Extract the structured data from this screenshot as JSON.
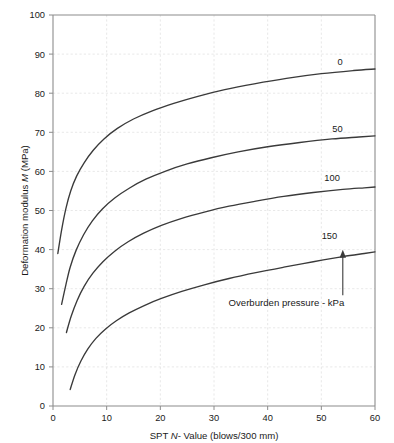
{
  "chart_data": {
    "type": "line",
    "title": "",
    "xlabel": "SPT N- Value (blows/300 mm)",
    "xlabel_parts": {
      "pre": "SPT ",
      "italic": "N",
      "post": "- Value (blows/300 mm)"
    },
    "ylabel": "Deformation modulus M (MPa)",
    "ylabel_parts": {
      "pre": "Deformation modulus ",
      "italic": "M",
      "post": " (MPa)"
    },
    "xlim": [
      0,
      60
    ],
    "ylim": [
      0,
      100
    ],
    "xticks": [
      0,
      10,
      20,
      30,
      40,
      50,
      60
    ],
    "yticks": [
      0,
      10,
      20,
      30,
      40,
      50,
      60,
      70,
      80,
      90,
      100
    ],
    "grid": true,
    "legend_position": "inline-right-of-curve",
    "annotations": [
      {
        "text": "Overburden pressure - kPa",
        "x": 43.5,
        "y": 25.5,
        "arrow_to_x": 54.0,
        "arrow_to_y": 41.5
      }
    ],
    "series": [
      {
        "name": "0",
        "label": "0",
        "label_x": 53.5,
        "label_y": 88.0,
        "x": [
          0.9,
          1.6,
          2.4,
          3.3,
          4.4,
          5.8,
          7.5,
          9.5,
          12.0,
          15.0,
          18.5,
          22.5,
          27.0,
          32.0,
          37.5,
          43.5,
          50.0,
          56.0,
          60.0
        ],
        "y": [
          39.0,
          45.0,
          50.5,
          55.0,
          58.8,
          62.2,
          65.4,
          68.3,
          71.0,
          73.4,
          75.5,
          77.4,
          79.2,
          80.9,
          82.4,
          83.8,
          85.0,
          85.8,
          86.2
        ]
      },
      {
        "name": "50",
        "label": "50",
        "label_x": 53.0,
        "label_y": 71.0,
        "x": [
          1.6,
          2.4,
          3.2,
          4.3,
          5.7,
          7.3,
          9.2,
          11.5,
          14.2,
          17.3,
          21.0,
          25.0,
          29.5,
          34.5,
          40.0,
          46.0,
          52.0,
          57.0,
          60.0
        ],
        "y": [
          26.0,
          31.0,
          35.5,
          39.8,
          43.8,
          47.3,
          50.4,
          53.2,
          55.7,
          58.0,
          60.1,
          61.9,
          63.5,
          65.0,
          66.3,
          67.4,
          68.3,
          68.8,
          69.1
        ]
      },
      {
        "name": "100",
        "label": "100",
        "label_x": 52.0,
        "label_y": 58.5,
        "x": [
          2.5,
          3.4,
          4.5,
          5.8,
          7.4,
          9.3,
          11.5,
          14.0,
          16.9,
          20.2,
          24.0,
          28.2,
          32.8,
          37.8,
          43.0,
          48.5,
          54.0,
          58.0,
          60.0
        ],
        "y": [
          18.8,
          23.0,
          27.0,
          30.6,
          33.9,
          36.9,
          39.6,
          42.0,
          44.2,
          46.2,
          48.0,
          49.6,
          51.1,
          52.4,
          53.6,
          54.6,
          55.4,
          55.8,
          56.0
        ]
      },
      {
        "name": "150",
        "label": "150",
        "label_x": 51.5,
        "label_y": 43.5,
        "x": [
          3.2,
          4.1,
          5.2,
          6.5,
          8.0,
          9.8,
          11.8,
          14.2,
          17.0,
          20.2,
          24.0,
          28.2,
          32.8,
          37.8,
          43.0,
          48.5,
          54.0,
          58.0,
          60.0
        ],
        "y": [
          4.2,
          8.0,
          11.5,
          14.6,
          17.3,
          19.7,
          21.8,
          23.8,
          25.7,
          27.5,
          29.3,
          31.0,
          32.6,
          34.1,
          35.5,
          36.9,
          38.2,
          39.0,
          39.4
        ]
      }
    ]
  },
  "plot_geometry": {
    "left": 53,
    "right": 375,
    "top": 15,
    "bottom": 406
  }
}
